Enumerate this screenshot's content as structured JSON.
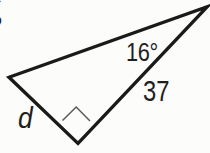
{
  "figure": {
    "labels": {
      "angle": {
        "text": "16°",
        "x": 126,
        "y": 39
      },
      "hypotenuse": {
        "text": "37",
        "x": 143,
        "y": 77
      },
      "side_d": {
        "text": "d",
        "x": 18,
        "y": 103
      },
      "corner": {
        "text": "g",
        "x": -16,
        "y": -10
      }
    },
    "geometry": {
      "width": 210,
      "height": 153,
      "triangle_points": [
        [
          9,
          77.3
        ],
        [
          207.3,
          6.7
        ],
        [
          78,
          143.5
        ]
      ],
      "right_angle_marker_points": [
        [
          62.5,
          120.5
        ],
        [
          76.2,
          107
        ],
        [
          90,
          121
        ]
      ],
      "outline_stroke_width": 3.3,
      "marker_stroke_width": 1.5
    },
    "colors": {
      "background": "#fcfcfa",
      "line": "#1a1a1a",
      "marker_line": "#5a5a5a",
      "text": "#1f1f1f"
    }
  }
}
